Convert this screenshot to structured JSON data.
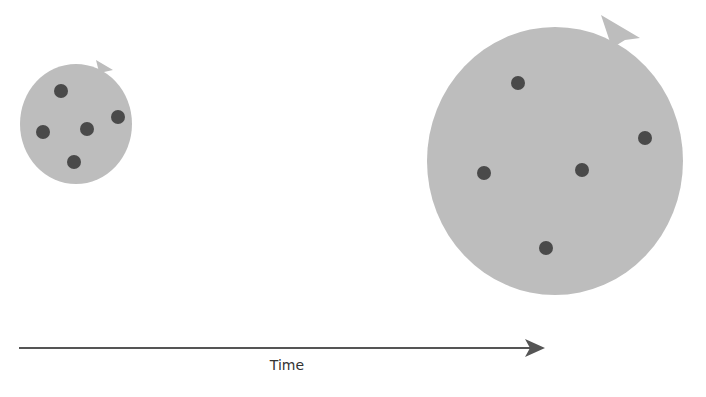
{
  "diagram": {
    "axis_label": "Time",
    "colors": {
      "balloon": "#bdbdbd",
      "dot": "#4a4a4a",
      "arrow": "#555555",
      "label": "#333333"
    },
    "balloons": [
      {
        "name": "small-balloon",
        "cx": 76,
        "cy": 124,
        "rx": 56,
        "ry": 60,
        "dots": [
          [
            61,
            91
          ],
          [
            118,
            117
          ],
          [
            43,
            132
          ],
          [
            87,
            129
          ],
          [
            74,
            162
          ]
        ]
      },
      {
        "name": "large-balloon",
        "cx": 555,
        "cy": 161,
        "rx": 128,
        "ry": 134,
        "dots": [
          [
            518,
            83
          ],
          [
            645,
            138
          ],
          [
            484,
            173
          ],
          [
            582,
            170
          ],
          [
            546,
            248
          ]
        ]
      }
    ]
  }
}
